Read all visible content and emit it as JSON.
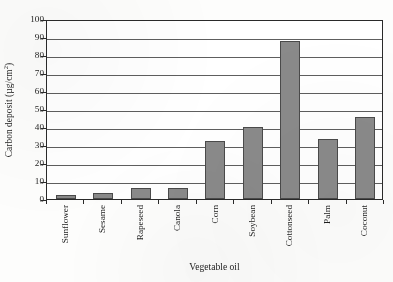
{
  "chart_data": {
    "type": "bar",
    "title": "",
    "xlabel": "Vegetable oil",
    "ylabel": "Carbon deposit (µg/cm²)",
    "ylabel_main": "Carbon deposit (µg/cm",
    "ylabel_sup": "2",
    "ylabel_tail": ")",
    "categories": [
      "Sunflower",
      "Sesame",
      "Rapeseed",
      "Canola",
      "Corn",
      "Soybean",
      "Cottonseed",
      "Palm",
      "Coconut"
    ],
    "values": [
      2.0,
      3.3,
      6.0,
      6.2,
      32.5,
      40.0,
      88.0,
      33.5,
      45.5
    ],
    "ylim": [
      0,
      100
    ],
    "ytick_step": 10,
    "yticks": [
      0,
      10,
      20,
      30,
      40,
      50,
      60,
      70,
      80,
      90,
      100
    ],
    "ytick_labels": [
      "0",
      "10",
      "20",
      "30",
      "40",
      "50",
      "60",
      "70",
      "80",
      "90",
      "100"
    ],
    "grid": true,
    "grid_axis": "y",
    "legend": false,
    "bar_color": "#8a8a8a",
    "bar_edge_color": "#4a4a4a",
    "axis_color": "#2a2a2a",
    "gridline_color": "#5e5e5e",
    "background_color": "#ffffff"
  }
}
